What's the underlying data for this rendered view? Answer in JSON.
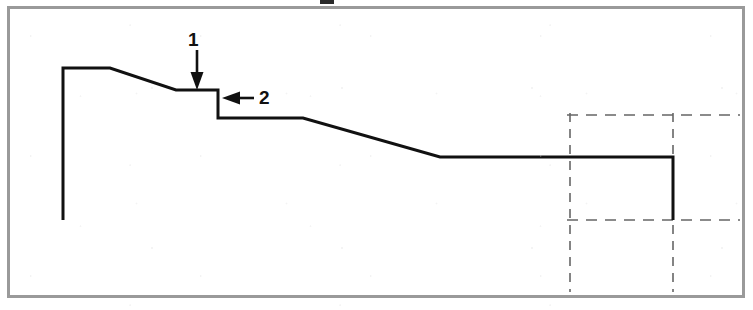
{
  "figure": {
    "kind": "technical-profile-drawing",
    "frame_color": "#9a9a9a",
    "line_color": "#111111",
    "dashed_color": "#666666",
    "background": "#ffffff",
    "width": 753,
    "height": 310
  },
  "callouts": [
    {
      "id": "callout-1",
      "label": "1",
      "label_x": 188,
      "label_y": 30,
      "arrow_direction": "down",
      "arrow_from_x": 197,
      "arrow_from_y": 50,
      "arrow_to_x": 197,
      "arrow_to_y": 88
    },
    {
      "id": "callout-2",
      "label": "2",
      "label_x": 259,
      "label_y": 88,
      "arrow_direction": "left",
      "arrow_from_x": 252,
      "arrow_from_y": 98,
      "arrow_to_x": 223,
      "arrow_to_y": 98
    }
  ],
  "profile": {
    "name": "stepped-profile-outline",
    "stroke_width": 3,
    "points": [
      [
        63,
        220
      ],
      [
        63,
        68
      ],
      [
        110,
        68
      ],
      [
        176,
        90
      ],
      [
        218,
        90
      ],
      [
        218,
        118
      ],
      [
        303,
        118
      ],
      [
        440,
        157
      ],
      [
        673,
        157
      ],
      [
        673,
        220
      ]
    ]
  },
  "construction_lines": [
    {
      "name": "dashed-vertical-left",
      "orientation": "vertical",
      "x": 570,
      "y1": 113,
      "y2": 292
    },
    {
      "name": "dashed-vertical-right",
      "orientation": "vertical",
      "x": 673,
      "y1": 113,
      "y2": 292
    },
    {
      "name": "dashed-horizontal-top",
      "orientation": "horizontal",
      "y": 115,
      "x1": 567,
      "x2": 740
    },
    {
      "name": "dashed-horizontal-bottom",
      "orientation": "horizontal",
      "y": 220,
      "x1": 567,
      "x2": 740
    }
  ]
}
